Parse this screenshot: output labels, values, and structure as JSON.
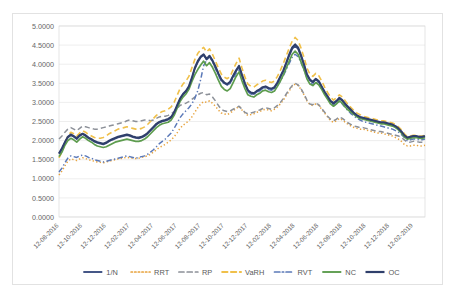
{
  "chart_data": {
    "type": "line",
    "title": "",
    "xlabel": "",
    "ylabel": "",
    "ylim": [
      0.0,
      5.0
    ],
    "ytick_step": 0.5,
    "ytick_labels": [
      "0.0000",
      "0.5000",
      "1.0000",
      "1.5000",
      "2.0000",
      "2.5000",
      "3.0000",
      "3.5000",
      "4.0000",
      "4.5000",
      "5.0000"
    ],
    "grid": true,
    "legend_position": "bottom",
    "x_tick_labels": [
      "12-08-2016",
      "12-10-2016",
      "12-12-2016",
      "12-02-2017",
      "12-04-2017",
      "12-06-2017",
      "12-08-2017",
      "12-10-2017",
      "12-12-2017",
      "12-02-2018",
      "12-04-2018",
      "12-06-2018",
      "12-08-2018",
      "12-10-2018",
      "12-12-2018",
      "12-02-2019"
    ],
    "x_tick_positions": [
      0,
      8,
      16,
      24,
      32,
      40,
      48,
      56,
      64,
      72,
      80,
      88,
      96,
      104,
      112,
      120
    ],
    "n_points": 125,
    "series": [
      {
        "name": "1/N",
        "color": "#3b4f81",
        "style": "solid",
        "width": 1.7,
        "values": [
          1.66,
          1.78,
          1.95,
          2.08,
          2.14,
          2.1,
          2.04,
          2.12,
          2.17,
          2.12,
          2.06,
          2.02,
          1.97,
          1.94,
          1.92,
          1.9,
          1.93,
          1.98,
          2.02,
          2.05,
          2.08,
          2.1,
          2.12,
          2.14,
          2.12,
          2.09,
          2.07,
          2.06,
          2.08,
          2.12,
          2.18,
          2.26,
          2.34,
          2.42,
          2.47,
          2.5,
          2.52,
          2.55,
          2.6,
          2.72,
          2.9,
          3.08,
          3.2,
          3.28,
          3.4,
          3.62,
          3.88,
          4.05,
          4.18,
          4.24,
          4.12,
          4.2,
          4.08,
          3.92,
          3.74,
          3.58,
          3.5,
          3.46,
          3.52,
          3.68,
          3.82,
          3.94,
          3.7,
          3.48,
          3.3,
          3.24,
          3.22,
          3.28,
          3.32,
          3.38,
          3.4,
          3.36,
          3.34,
          3.38,
          3.5,
          3.66,
          3.82,
          4.02,
          4.22,
          4.4,
          4.48,
          4.4,
          4.2,
          3.98,
          3.72,
          3.58,
          3.52,
          3.6,
          3.54,
          3.4,
          3.26,
          3.14,
          3.02,
          2.96,
          3.02,
          3.1,
          3.04,
          2.94,
          2.86,
          2.78,
          2.7,
          2.64,
          2.6,
          2.58,
          2.56,
          2.54,
          2.52,
          2.5,
          2.48,
          2.46,
          2.46,
          2.44,
          2.42,
          2.4,
          2.36,
          2.3,
          2.22,
          2.12,
          2.06,
          2.08,
          2.1,
          2.1,
          2.08,
          2.08,
          2.1
        ]
      },
      {
        "name": "RRT",
        "color": "#e8a33d",
        "style": "dotted",
        "width": 1.5,
        "values": [
          1.1,
          1.2,
          1.34,
          1.46,
          1.52,
          1.5,
          1.48,
          1.52,
          1.55,
          1.53,
          1.5,
          1.48,
          1.46,
          1.44,
          1.43,
          1.42,
          1.44,
          1.46,
          1.48,
          1.5,
          1.52,
          1.53,
          1.55,
          1.56,
          1.55,
          1.54,
          1.53,
          1.54,
          1.56,
          1.58,
          1.6,
          1.64,
          1.7,
          1.76,
          1.82,
          1.86,
          1.9,
          1.96,
          2.02,
          2.1,
          2.2,
          2.32,
          2.4,
          2.46,
          2.52,
          2.62,
          2.74,
          2.86,
          2.96,
          3.02,
          3.0,
          3.04,
          2.98,
          2.9,
          2.8,
          2.72,
          2.7,
          2.68,
          2.72,
          2.78,
          2.84,
          2.9,
          2.8,
          2.72,
          2.66,
          2.68,
          2.7,
          2.74,
          2.76,
          2.8,
          2.82,
          2.8,
          2.78,
          2.82,
          2.88,
          2.96,
          3.06,
          3.18,
          3.3,
          3.42,
          3.48,
          3.44,
          3.34,
          3.2,
          3.04,
          2.94,
          2.92,
          2.96,
          2.92,
          2.82,
          2.72,
          2.62,
          2.52,
          2.48,
          2.52,
          2.58,
          2.54,
          2.48,
          2.42,
          2.38,
          2.34,
          2.32,
          2.3,
          2.3,
          2.28,
          2.26,
          2.24,
          2.22,
          2.2,
          2.2,
          2.18,
          2.16,
          2.14,
          2.12,
          2.08,
          2.04,
          1.98,
          1.9,
          1.86,
          1.86,
          1.88,
          1.88,
          1.86,
          1.86,
          1.88
        ]
      },
      {
        "name": "RP",
        "color": "#8c9098",
        "style": "dashed",
        "width": 1.5,
        "values": [
          2.04,
          2.12,
          2.22,
          2.3,
          2.34,
          2.3,
          2.26,
          2.32,
          2.38,
          2.36,
          2.34,
          2.32,
          2.3,
          2.3,
          2.32,
          2.34,
          2.36,
          2.38,
          2.4,
          2.42,
          2.44,
          2.46,
          2.48,
          2.52,
          2.54,
          2.52,
          2.5,
          2.5,
          2.52,
          2.54,
          2.54,
          2.52,
          2.54,
          2.58,
          2.62,
          2.64,
          2.64,
          2.66,
          2.7,
          2.76,
          2.84,
          2.92,
          2.96,
          2.98,
          3.02,
          3.08,
          3.14,
          3.2,
          3.24,
          3.26,
          3.2,
          3.22,
          3.14,
          3.04,
          2.92,
          2.82,
          2.78,
          2.76,
          2.78,
          2.82,
          2.86,
          2.9,
          2.82,
          2.74,
          2.7,
          2.72,
          2.74,
          2.78,
          2.8,
          2.84,
          2.86,
          2.84,
          2.82,
          2.86,
          2.92,
          3.0,
          3.1,
          3.22,
          3.34,
          3.44,
          3.5,
          3.46,
          3.36,
          3.22,
          3.06,
          2.96,
          2.94,
          2.98,
          2.94,
          2.84,
          2.74,
          2.64,
          2.56,
          2.52,
          2.56,
          2.62,
          2.58,
          2.52,
          2.46,
          2.42,
          2.38,
          2.36,
          2.34,
          2.34,
          2.32,
          2.3,
          2.28,
          2.26,
          2.24,
          2.24,
          2.22,
          2.2,
          2.18,
          2.16,
          2.14,
          2.12,
          2.08,
          2.02,
          1.96,
          1.96,
          1.98,
          1.98,
          1.96,
          1.96,
          1.98
        ]
      },
      {
        "name": "VaRH",
        "color": "#f0c04a",
        "style": "dashed",
        "width": 1.6,
        "values": [
          1.55,
          1.7,
          1.92,
          2.12,
          2.22,
          2.18,
          2.12,
          2.2,
          2.26,
          2.22,
          2.16,
          2.12,
          2.08,
          2.06,
          2.06,
          2.08,
          2.12,
          2.18,
          2.22,
          2.26,
          2.3,
          2.32,
          2.34,
          2.36,
          2.34,
          2.32,
          2.3,
          2.3,
          2.32,
          2.36,
          2.42,
          2.5,
          2.58,
          2.66,
          2.72,
          2.76,
          2.78,
          2.82,
          2.88,
          3.0,
          3.18,
          3.36,
          3.48,
          3.56,
          3.68,
          3.9,
          4.12,
          4.28,
          4.38,
          4.44,
          4.32,
          4.4,
          4.26,
          4.08,
          3.9,
          3.74,
          3.66,
          3.62,
          3.68,
          3.86,
          4.02,
          4.16,
          3.9,
          3.66,
          3.48,
          3.42,
          3.4,
          3.46,
          3.5,
          3.56,
          3.58,
          3.54,
          3.52,
          3.56,
          3.68,
          3.84,
          4.02,
          4.22,
          4.42,
          4.6,
          4.7,
          4.62,
          4.42,
          4.18,
          3.9,
          3.74,
          3.68,
          3.76,
          3.7,
          3.56,
          3.4,
          3.26,
          3.14,
          3.06,
          3.12,
          3.2,
          3.14,
          3.04,
          2.94,
          2.86,
          2.78,
          2.72,
          2.68,
          2.64,
          2.62,
          2.6,
          2.58,
          2.56,
          2.54,
          2.52,
          2.52,
          2.5,
          2.48,
          2.46,
          2.42,
          2.36,
          2.28,
          2.18,
          2.1,
          2.12,
          2.14,
          2.14,
          2.12,
          2.12,
          2.14
        ]
      },
      {
        "name": "RVT",
        "color": "#5b79b8",
        "style": "dashdot",
        "width": 1.5,
        "values": [
          1.18,
          1.28,
          1.42,
          1.54,
          1.6,
          1.58,
          1.56,
          1.6,
          1.62,
          1.6,
          1.56,
          1.54,
          1.5,
          1.48,
          1.46,
          1.44,
          1.46,
          1.48,
          1.5,
          1.52,
          1.54,
          1.56,
          1.58,
          1.6,
          1.58,
          1.56,
          1.54,
          1.56,
          1.58,
          1.6,
          1.64,
          1.7,
          1.76,
          1.84,
          1.92,
          1.98,
          2.04,
          2.12,
          2.2,
          2.32,
          2.46,
          2.6,
          2.7,
          2.78,
          2.86,
          2.96,
          3.1,
          3.3,
          3.6,
          3.96,
          4.1,
          4.22,
          4.06,
          3.88,
          3.7,
          3.56,
          3.48,
          3.46,
          3.5,
          3.62,
          3.76,
          3.88,
          3.64,
          3.44,
          3.28,
          3.22,
          3.2,
          3.26,
          3.3,
          3.36,
          3.38,
          3.34,
          3.32,
          3.36,
          3.44,
          3.56,
          3.7,
          3.86,
          4.02,
          4.18,
          4.26,
          4.2,
          4.04,
          3.86,
          3.64,
          3.52,
          3.46,
          3.54,
          3.48,
          3.36,
          3.24,
          3.12,
          3.0,
          2.92,
          2.96,
          3.02,
          2.96,
          2.86,
          2.78,
          2.7,
          2.64,
          2.58,
          2.54,
          2.5,
          2.48,
          2.46,
          2.44,
          2.42,
          2.4,
          2.38,
          2.36,
          2.34,
          2.32,
          2.3,
          2.26,
          2.22,
          2.16,
          2.08,
          2.0,
          2.02,
          2.04,
          2.04,
          2.02,
          2.02,
          2.04
        ]
      },
      {
        "name": "NC",
        "color": "#5d9c4e",
        "style": "solid",
        "width": 1.7,
        "values": [
          1.58,
          1.7,
          1.88,
          2.0,
          2.06,
          2.02,
          1.96,
          2.04,
          2.1,
          2.06,
          2.0,
          1.96,
          1.9,
          1.86,
          1.84,
          1.82,
          1.84,
          1.88,
          1.92,
          1.96,
          1.98,
          2.0,
          2.02,
          2.04,
          2.02,
          2.0,
          1.98,
          1.98,
          2.0,
          2.04,
          2.1,
          2.18,
          2.26,
          2.34,
          2.4,
          2.44,
          2.46,
          2.48,
          2.54,
          2.66,
          2.84,
          3.02,
          3.14,
          3.22,
          3.34,
          3.54,
          3.72,
          3.86,
          3.98,
          4.08,
          3.96,
          4.04,
          3.92,
          3.76,
          3.58,
          3.42,
          3.34,
          3.3,
          3.36,
          3.52,
          3.68,
          3.8,
          3.56,
          3.36,
          3.2,
          3.16,
          3.14,
          3.2,
          3.24,
          3.3,
          3.32,
          3.28,
          3.26,
          3.3,
          3.42,
          3.56,
          3.72,
          3.9,
          4.08,
          4.26,
          4.34,
          4.26,
          4.06,
          3.86,
          3.62,
          3.48,
          3.44,
          3.52,
          3.46,
          3.34,
          3.2,
          3.08,
          2.96,
          2.9,
          2.96,
          3.04,
          2.98,
          2.88,
          2.8,
          2.74,
          2.68,
          2.62,
          2.58,
          2.56,
          2.54,
          2.52,
          2.5,
          2.48,
          2.46,
          2.44,
          2.44,
          2.42,
          2.4,
          2.38,
          2.34,
          2.28,
          2.2,
          2.1,
          2.04,
          2.06,
          2.08,
          2.08,
          2.06,
          2.06,
          2.08
        ]
      },
      {
        "name": "OC",
        "color": "#2f3f6b",
        "style": "solid",
        "width": 2.0,
        "values": [
          1.66,
          1.8,
          1.96,
          2.1,
          2.16,
          2.12,
          2.06,
          2.14,
          2.18,
          2.14,
          2.08,
          2.04,
          1.99,
          1.96,
          1.94,
          1.92,
          1.95,
          2.0,
          2.04,
          2.07,
          2.1,
          2.12,
          2.14,
          2.16,
          2.14,
          2.11,
          2.09,
          2.08,
          2.1,
          2.14,
          2.2,
          2.28,
          2.36,
          2.44,
          2.49,
          2.52,
          2.54,
          2.57,
          2.62,
          2.74,
          2.92,
          3.1,
          3.22,
          3.3,
          3.42,
          3.64,
          3.9,
          4.08,
          4.2,
          4.26,
          4.14,
          4.22,
          4.1,
          3.94,
          3.76,
          3.6,
          3.52,
          3.48,
          3.54,
          3.7,
          3.84,
          3.96,
          3.72,
          3.5,
          3.32,
          3.26,
          3.24,
          3.3,
          3.34,
          3.4,
          3.42,
          3.38,
          3.36,
          3.4,
          3.52,
          3.68,
          3.84,
          4.04,
          4.26,
          4.44,
          4.52,
          4.44,
          4.24,
          4.0,
          3.74,
          3.6,
          3.54,
          3.62,
          3.56,
          3.42,
          3.28,
          3.16,
          3.04,
          2.98,
          3.04,
          3.12,
          3.06,
          2.96,
          2.88,
          2.8,
          2.72,
          2.66,
          2.62,
          2.6,
          2.58,
          2.56,
          2.54,
          2.52,
          2.5,
          2.48,
          2.48,
          2.46,
          2.44,
          2.42,
          2.38,
          2.32,
          2.24,
          2.14,
          2.08,
          2.1,
          2.12,
          2.12,
          2.1,
          2.1,
          2.12
        ]
      }
    ]
  }
}
